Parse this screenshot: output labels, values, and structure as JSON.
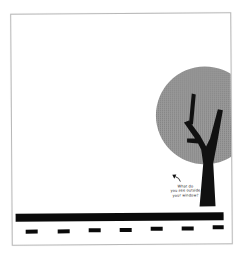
{
  "illustration": {
    "caption_lines": [
      "What do",
      "you see outside",
      "your window?"
    ],
    "colors": {
      "background": "#ffffff",
      "frame": "#b8b8b8",
      "foliage": "#8c8c8c",
      "trunk": "#111111",
      "road": "#0a0a0a",
      "text": "#222222"
    },
    "elements": [
      "foliage-circle",
      "tree-trunk",
      "road",
      "lane-dashes",
      "arrow",
      "caption"
    ],
    "lane_dash_count": 7
  }
}
